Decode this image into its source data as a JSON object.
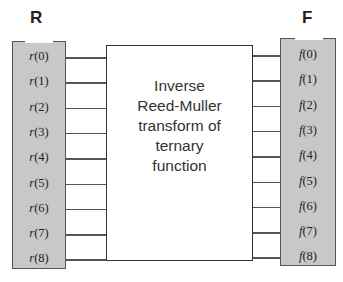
{
  "left": {
    "title": "R",
    "items": [
      {
        "fn": "r",
        "idx": "(0)"
      },
      {
        "fn": "r",
        "idx": "(1)"
      },
      {
        "fn": "r",
        "idx": "(2)"
      },
      {
        "fn": "r",
        "idx": "(3)"
      },
      {
        "fn": "r",
        "idx": "(4)"
      },
      {
        "fn": "r",
        "idx": "(5)"
      },
      {
        "fn": "r",
        "idx": "(6)"
      },
      {
        "fn": "r",
        "idx": "(7)"
      },
      {
        "fn": "r",
        "idx": "(8)"
      }
    ]
  },
  "right": {
    "title": "F",
    "items": [
      {
        "fn": "f",
        "idx": "(0)"
      },
      {
        "fn": "f",
        "idx": "(1)"
      },
      {
        "fn": "f",
        "idx": "(2)"
      },
      {
        "fn": "f",
        "idx": "(3)"
      },
      {
        "fn": "f",
        "idx": "(4)"
      },
      {
        "fn": "f",
        "idx": "(5)"
      },
      {
        "fn": "f",
        "idx": "(6)"
      },
      {
        "fn": "f",
        "idx": "(7)"
      },
      {
        "fn": "f",
        "idx": "(8)"
      }
    ]
  },
  "box": {
    "lines": [
      "Inverse",
      "Reed-Muller",
      "transform of",
      "ternary",
      "function"
    ]
  },
  "colors": {
    "column_fill": "#c8c8c8",
    "border": "#555555"
  }
}
